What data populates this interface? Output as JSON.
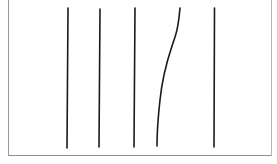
{
  "diagram": {
    "frame": {
      "border_color": "#9a9a9a",
      "background": "#ffffff"
    },
    "line_color": "#1a1a1a",
    "lines": [
      {
        "id": "line-1",
        "type": "straight",
        "x1": 68,
        "y1": 8,
        "x2": 67,
        "y2": 148
      },
      {
        "id": "line-2",
        "type": "straight",
        "x1": 100,
        "y1": 9,
        "x2": 99,
        "y2": 147
      },
      {
        "id": "line-3",
        "type": "straight",
        "x1": 135,
        "y1": 8,
        "x2": 134,
        "y2": 147
      },
      {
        "id": "line-4",
        "type": "curved",
        "path": "M180,8 C178,30 176,34 172,46 C166,64 162,80 160,100 C158,118 157,130 157,146"
      },
      {
        "id": "line-5",
        "type": "straight",
        "x1": 214.5,
        "y1": 8,
        "x2": 214,
        "y2": 147
      }
    ]
  }
}
